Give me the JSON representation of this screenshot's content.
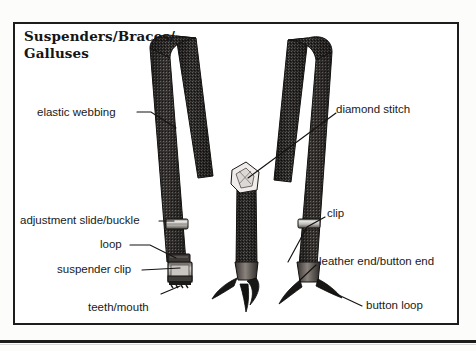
{
  "figure": {
    "title_line1": "Suspenders/Braces/",
    "title_line2": "Galluses",
    "style": "black-and-white line drawing with leader-line callouts",
    "background_color": "#ffffff",
    "ink_color": "#1a1a1a",
    "frame_color": "#1d1d1d"
  },
  "labels": [
    {
      "id": "elastic-webbing",
      "text": "elastic webbing"
    },
    {
      "id": "diamond-stitch",
      "text": "diamond stitch"
    },
    {
      "id": "adjustment-slide-buckle",
      "text": "adjustment slide/buckle"
    },
    {
      "id": "loop",
      "text": "loop"
    },
    {
      "id": "suspender-clip",
      "text": "suspender clip"
    },
    {
      "id": "teeth-mouth",
      "text": "teeth/mouth"
    },
    {
      "id": "clip",
      "text": "clip"
    },
    {
      "id": "leather-end-button-end",
      "text": "leather end/button end"
    },
    {
      "id": "button-loop",
      "text": "button loop"
    }
  ]
}
